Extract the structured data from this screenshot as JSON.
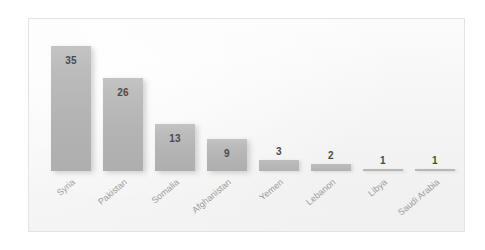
{
  "chart_data": {
    "type": "bar",
    "title": "",
    "subtitle": "",
    "xlabel": "",
    "ylabel": "",
    "ylim": [
      0,
      38
    ],
    "grid": false,
    "legend": "none",
    "orientation": "vertical",
    "categories": [
      "Syria",
      "Pakistan",
      "Somalia",
      "Afghanistan",
      "Yemen",
      "Lebanon",
      "Libya",
      "Saudi Arabia"
    ],
    "values": [
      35,
      26,
      13,
      9,
      3,
      2,
      1,
      1
    ],
    "data_labels": [
      "35",
      "26",
      "13",
      "9",
      "3",
      "2",
      "1",
      "1"
    ],
    "bar_color": "#b8b8b8",
    "plot_background": "#f7f7f7",
    "frame_border_color": "#e3e3e3",
    "label_color": "#9a9a9a",
    "value_color": "#4a4a4a",
    "label_rotation_degrees": -40
  },
  "bars": [
    {
      "category": "Syria",
      "value": 35,
      "label": "35",
      "category_label": "Syria"
    },
    {
      "category": "Pakistan",
      "value": 26,
      "label": "26",
      "category_label": "Pakistan"
    },
    {
      "category": "Somalia",
      "value": 13,
      "label": "13",
      "category_label": "Somalia"
    },
    {
      "category": "Afghanistan",
      "value": 9,
      "label": "9",
      "category_label": "Afghanistan"
    },
    {
      "category": "Yemen",
      "value": 3,
      "label": "3",
      "category_label": "Yemen"
    },
    {
      "category": "Lebanon",
      "value": 2,
      "label": "2",
      "category_label": "Lebanon"
    },
    {
      "category": "Libya",
      "value": 1,
      "label": "1",
      "category_label": "Libya"
    },
    {
      "category": "Saudi Arabia",
      "value": 1,
      "label": "1",
      "category_label": "Saudi Arabia"
    }
  ]
}
